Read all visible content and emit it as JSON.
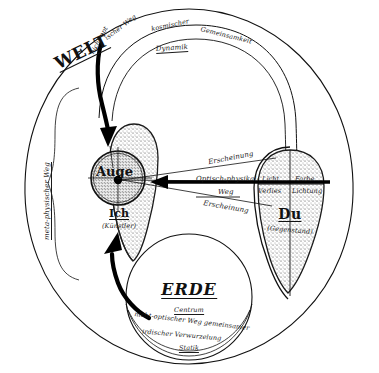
{
  "diagram": {
    "title_world": "WELT",
    "title_earth": "ERDE",
    "node_eye": "Auge",
    "node_self": "Ich",
    "node_self_paren": "(Künstler)",
    "node_other": "Du",
    "node_other_paren": "(Gegenstand)",
    "top_path_line1": "nicht-optischer Weg kosmischer Gemeinsamkeit",
    "top_path_line2": "Dynamik",
    "left_path": "meta-physischer Weg",
    "center_arrow_line1": "Optisch-physikal-",
    "center_arrow_line2": "Weg",
    "appearance_upper": "Erscheinung",
    "appearance_lower": "Erscheinung",
    "du_top_left": "Licht",
    "du_top_right": "Farbe",
    "du_mid_left": "Verlies",
    "du_mid_right": "Lichtung",
    "earth_center": "Centrum",
    "earth_path_line1": "nicht-optischer Weg gemeinsamer",
    "earth_path_line2": "irdischer Verwurzelung",
    "earth_path_line3": "Statik"
  },
  "colors": {
    "ink": "#111111",
    "stipple": "#2a2a2a",
    "paper": "#ffffff"
  }
}
